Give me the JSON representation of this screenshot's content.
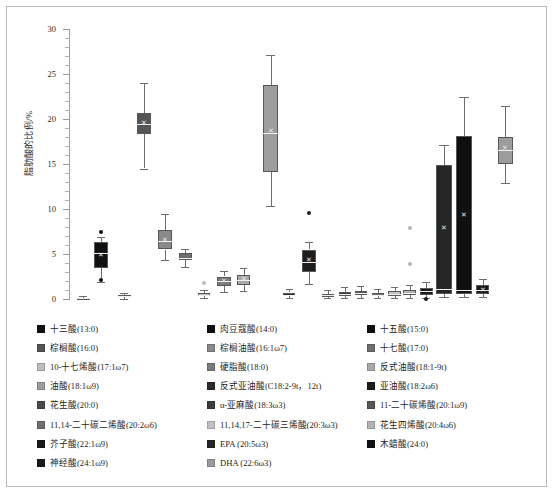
{
  "figure": {
    "background": "#ffffff",
    "border_color": "#b9b9b9"
  },
  "axis": {
    "ylabel": "脂肪酸的比例/%",
    "tick_labels": [
      "0",
      "5",
      "10",
      "15",
      "20",
      "25",
      "30"
    ],
    "ymin": 0,
    "ymax": 30,
    "major_step": 5,
    "minor_step": 1
  },
  "legend": {
    "columns": 3,
    "entries": [
      {
        "label": "十三酸(13:0)",
        "color": "#111111"
      },
      {
        "label": "肉豆蔻酸(14:0)",
        "color": "#111111"
      },
      {
        "label": "十五酸(15:0)",
        "color": "#111111"
      },
      {
        "label": "棕榈酸(16:0)",
        "color": "#555555"
      },
      {
        "label": "棕榈油酸(16:1ω7)",
        "color": "#8a8a8a"
      },
      {
        "label": "十七酸(17:0)",
        "color": "#6e6e6e"
      },
      {
        "label": "10-十七烯酸(17:1ω7)",
        "color": "#bdbdbd"
      },
      {
        "label": "硬脂酸(18:0)",
        "color": "#7b7b7b"
      },
      {
        "label": "反式油酸(18:1-9t)",
        "color": "#a9a9a9"
      },
      {
        "label": "油酸(18:1ω9)",
        "color": "#9e9e9e"
      },
      {
        "label": "反式亚油酸(C18:2-9t，12t)",
        "color": "#2c2c2c"
      },
      {
        "label": "亚油酸(18:2ω6)",
        "color": "#1d1d1d"
      },
      {
        "label": "花生酸(20:0)",
        "color": "#4a4a4a"
      },
      {
        "label": "α-亚麻酸(18:3ω3)",
        "color": "#3c3c3c"
      },
      {
        "label": "11-二十碳烯酸(20:1ω9)",
        "color": "#585858"
      },
      {
        "label": "11,14-二十碳二烯酸(20:2ω6)",
        "color": "#707070"
      },
      {
        "label": "11,14,17-二十碳三烯酸(20:3ω3)",
        "color": "#c2c2c2"
      },
      {
        "label": "花生四烯酸(20:4ω6)",
        "color": "#b4b4b4"
      },
      {
        "label": "芥子酸(22:1ω9)",
        "color": "#1a1a1a"
      },
      {
        "label": "EPA (20:5ω3)",
        "color": "#262626"
      },
      {
        "label": "木蜡酸(24:0)",
        "color": "#101010"
      },
      {
        "label": "神经酸(24:1ω9)",
        "color": "#1a1a1a"
      },
      {
        "label": "DHA (22:6ω3)",
        "color": "#9c9c9c"
      }
    ]
  },
  "chart_data": {
    "type": "box",
    "title": "",
    "xlabel": "",
    "ylabel": "脂肪酸的比例/%",
    "ylim": [
      0,
      30
    ],
    "grid": false,
    "legend_position": "below",
    "xtick_labels_shown": false,
    "boxes": [
      {
        "name": "十三酸(13:0)",
        "color": "#111111",
        "x": 0.03,
        "width": 0.028,
        "q1": 0.05,
        "median": 0.1,
        "q3": 0.16,
        "whisker_low": 0.02,
        "whisker_high": 0.3,
        "mean": 0.12,
        "outliers": []
      },
      {
        "name": "肉豆蔻酸(14:0)",
        "color": "#111111",
        "x": 0.068,
        "width": 0.03,
        "q1": 3.4,
        "median": 5.1,
        "q3": 6.3,
        "whisker_low": 1.9,
        "whisker_high": 6.9,
        "mean": 4.9,
        "outliers": [
          7.4,
          2.1
        ]
      },
      {
        "name": "十五酸(15:0)",
        "color": "#111111",
        "x": 0.118,
        "width": 0.028,
        "q1": 0.18,
        "median": 0.3,
        "q3": 0.46,
        "whisker_low": 0.05,
        "whisker_high": 0.72,
        "mean": 0.34,
        "outliers": []
      },
      {
        "name": "棕榈酸(16:0)",
        "color": "#555555",
        "x": 0.16,
        "width": 0.03,
        "q1": 18.3,
        "median": 19.5,
        "q3": 20.7,
        "whisker_low": 14.5,
        "whisker_high": 24.0,
        "mean": 19.6,
        "outliers": []
      },
      {
        "name": "棕榈油酸(16:1ω7)",
        "color": "#8a8a8a",
        "x": 0.205,
        "width": 0.03,
        "q1": 5.5,
        "median": 6.4,
        "q3": 7.7,
        "whisker_low": 4.3,
        "whisker_high": 9.5,
        "mean": 6.6,
        "outliers": []
      },
      {
        "name": "十七酸(17:0)",
        "color": "#6e6e6e",
        "x": 0.248,
        "width": 0.028,
        "q1": 4.3,
        "median": 4.6,
        "q3": 5.1,
        "whisker_low": 3.6,
        "whisker_high": 5.6,
        "mean": 4.7,
        "outliers": []
      },
      {
        "name": "10-十七烯酸(17:1ω7)",
        "color": "#bdbdbd",
        "x": 0.288,
        "width": 0.026,
        "q1": 0.3,
        "median": 0.45,
        "q3": 0.62,
        "whisker_low": 0.1,
        "whisker_high": 0.95,
        "mean": 0.48,
        "outliers": [
          1.8
        ]
      },
      {
        "name": "硬脂酸(18:0)",
        "color": "#7b7b7b",
        "x": 0.33,
        "width": 0.03,
        "q1": 1.5,
        "median": 2.0,
        "q3": 2.5,
        "whisker_low": 0.8,
        "whisker_high": 3.1,
        "mean": 2.0,
        "outliers": []
      },
      {
        "name": "反式油酸(18:1-9t)",
        "color": "#a9a9a9",
        "x": 0.372,
        "width": 0.028,
        "q1": 1.6,
        "median": 2.1,
        "q3": 2.7,
        "whisker_low": 0.9,
        "whisker_high": 3.4,
        "mean": 2.2,
        "outliers": []
      },
      {
        "name": "油酸(18:1ω9)",
        "color": "#9e9e9e",
        "x": 0.43,
        "width": 0.032,
        "q1": 14.1,
        "median": 18.4,
        "q3": 23.8,
        "whisker_low": 10.3,
        "whisker_high": 27.1,
        "mean": 18.7,
        "outliers": []
      },
      {
        "name": "反式亚油酸(C18:2-9t，12t)",
        "color": "#2c2c2c",
        "x": 0.47,
        "width": 0.026,
        "q1": 0.3,
        "median": 0.5,
        "q3": 0.72,
        "whisker_low": 0.1,
        "whisker_high": 1.1,
        "mean": 0.52,
        "outliers": []
      },
      {
        "name": "亚油酸(18:2ω6)",
        "color": "#1d1d1d",
        "x": 0.512,
        "width": 0.03,
        "q1": 3.0,
        "median": 4.1,
        "q3": 5.5,
        "whisker_low": 1.7,
        "whisker_high": 6.3,
        "mean": 4.3,
        "outliers": [
          9.6
        ]
      },
      {
        "name": "花生酸(20:0)",
        "color": "#4a4a4a",
        "x": 0.552,
        "width": 0.026,
        "q1": 0.25,
        "median": 0.4,
        "q3": 0.6,
        "whisker_low": 0.08,
        "whisker_high": 0.95,
        "mean": 0.42,
        "outliers": []
      },
      {
        "name": "α-亚麻酸(18:3ω3)",
        "color": "#3c3c3c",
        "x": 0.588,
        "width": 0.026,
        "q1": 0.35,
        "median": 0.55,
        "q3": 0.82,
        "whisker_low": 0.1,
        "whisker_high": 1.3,
        "mean": 0.6,
        "outliers": []
      },
      {
        "name": "11-二十碳烯酸(20:1ω9)",
        "color": "#585858",
        "x": 0.622,
        "width": 0.026,
        "q1": 0.4,
        "median": 0.62,
        "q3": 0.9,
        "whisker_low": 0.12,
        "whisker_high": 1.4,
        "mean": 0.66,
        "outliers": []
      },
      {
        "name": "11,14-二十碳二烯酸(20:2ω6)",
        "color": "#707070",
        "x": 0.658,
        "width": 0.026,
        "q1": 0.3,
        "median": 0.48,
        "q3": 0.7,
        "whisker_low": 0.08,
        "whisker_high": 1.1,
        "mean": 0.5,
        "outliers": []
      },
      {
        "name": "11,14,17-二十碳三烯酸(20:3ω3)",
        "color": "#c2c2c2",
        "x": 0.694,
        "width": 0.026,
        "q1": 0.35,
        "median": 0.55,
        "q3": 0.85,
        "whisker_low": 0.1,
        "whisker_high": 1.3,
        "mean": 0.58,
        "outliers": []
      },
      {
        "name": "花生四烯酸(20:4ω6)",
        "color": "#b4b4b4",
        "x": 0.726,
        "width": 0.026,
        "q1": 0.45,
        "median": 0.7,
        "q3": 1.0,
        "whisker_low": 0.15,
        "whisker_high": 1.6,
        "mean": 0.75,
        "outliers": [
          3.9,
          7.9
        ]
      },
      {
        "name": "芥子酸(22:1ω9)",
        "color": "#1a1a1a",
        "x": 0.762,
        "width": 0.028,
        "q1": 0.5,
        "median": 0.85,
        "q3": 1.25,
        "whisker_low": 0.15,
        "whisker_high": 1.9,
        "mean": 0.9,
        "outliers": [
          0.05
        ]
      },
      {
        "name": "EPA (20:5ω3)",
        "color": "#262626",
        "x": 0.8,
        "width": 0.034,
        "q1": 0.6,
        "median": 1.1,
        "q3": 14.9,
        "whisker_low": 0.2,
        "whisker_high": 17.1,
        "mean": 7.9,
        "outliers": []
      },
      {
        "name": "木蜡酸(24:0)",
        "color": "#101010",
        "x": 0.842,
        "width": 0.034,
        "q1": 0.55,
        "median": 1.05,
        "q3": 18.1,
        "whisker_low": 0.18,
        "whisker_high": 22.5,
        "mean": 9.3,
        "outliers": []
      },
      {
        "name": "神经酸(24:1ω9)",
        "color": "#1a1a1a",
        "x": 0.882,
        "width": 0.028,
        "q1": 0.6,
        "median": 1.0,
        "q3": 1.55,
        "whisker_low": 0.2,
        "whisker_high": 2.2,
        "mean": 1.05,
        "outliers": []
      },
      {
        "name": "DHA (22:6ω3)",
        "color": "#9c9c9c",
        "x": 0.93,
        "width": 0.032,
        "q1": 15.0,
        "median": 16.6,
        "q3": 18.0,
        "whisker_low": 12.9,
        "whisker_high": 21.4,
        "mean": 16.8,
        "outliers": []
      }
    ]
  }
}
